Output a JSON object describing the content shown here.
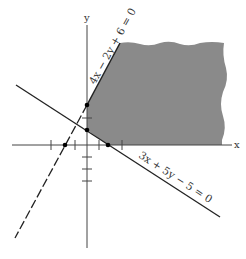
{
  "figure": {
    "axes": {
      "x_label": "x",
      "y_label": "y"
    },
    "lines": [
      {
        "equation": "4x − 2y + 6 = 0",
        "style": "solid above intersection, dashed below"
      },
      {
        "equation": "3x + 5y − 5 = 0",
        "style": "solid"
      }
    ],
    "region": {
      "description": "shaded feasible region",
      "color": "#8a8a8a"
    },
    "points": [
      {
        "name": "y-intercept of 4x-2y+6=0",
        "coord": "(0, 3)"
      },
      {
        "name": "y-intercept of 3x+5y-5=0",
        "coord": "(0, 1)"
      },
      {
        "name": "x-intercept of 3x+5y-5=0",
        "coord": "(5/3, 0)"
      },
      {
        "name": "x-intercept of 4x-2y+6=0",
        "coord": "(-3/2, 0)"
      }
    ]
  }
}
